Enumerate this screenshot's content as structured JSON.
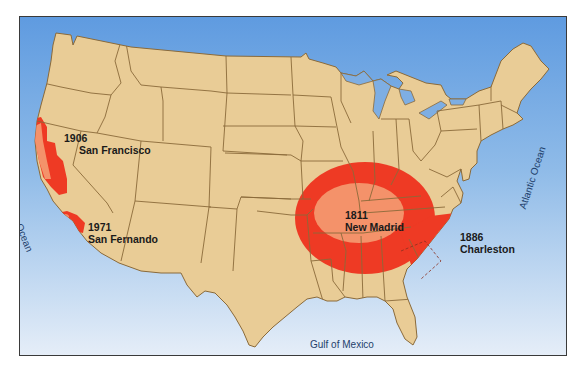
{
  "map": {
    "title": "Major historical earthquakes of the United States",
    "colors": {
      "ocean_top": "#6aa3de",
      "ocean_bottom": "#e3edf7",
      "land": "#e9cc96",
      "state_border": "#8a6a3a",
      "strong_shaking": "#ee3a24",
      "very_strong_shaking": "#f4926a"
    },
    "earthquakes": [
      {
        "year": "1906",
        "name": "San Francisco"
      },
      {
        "year": "1971",
        "name": "San Fernando"
      },
      {
        "year": "1811",
        "name": "New Madrid"
      },
      {
        "year": "1886",
        "name": "Charleston"
      }
    ],
    "water_labels": {
      "pacific": "Pacific Ocean",
      "atlantic": "Atlantic Ocean",
      "gulf": "Gulf of Mexico"
    }
  }
}
